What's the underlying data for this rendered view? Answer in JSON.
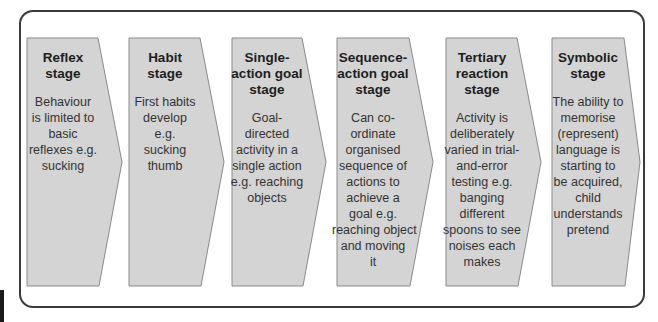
{
  "diagram": {
    "type": "process-chevron-flow",
    "colors": {
      "frame_border": "#3a3a3a",
      "shape_fill": "#d4d4d4",
      "shape_border": "#8a8a8a",
      "text": "#2b2b2b"
    },
    "stages": [
      {
        "title": "Reflex stage",
        "title_lines": [
          "Reflex",
          "stage"
        ],
        "description": "Behaviour is limited to basic reflexes e.g. sucking",
        "description_lines": [
          "Behaviour",
          "is limited to",
          "basic",
          "reflexes e.g.",
          "sucking"
        ]
      },
      {
        "title": "Habit stage",
        "title_lines": [
          "Habit",
          "stage"
        ],
        "description": "First habits develop e.g. sucking thumb",
        "description_lines": [
          "First habits",
          "develop",
          "e.g.",
          "sucking",
          "thumb"
        ]
      },
      {
        "title": "Single-action goal stage",
        "title_lines": [
          "Single-",
          "action goal",
          "stage"
        ],
        "description": "Goal-directed activity in a single action e.g. reaching objects",
        "description_lines": [
          "Goal-directed",
          "activity in a",
          "single action",
          "e.g. reaching",
          "objects"
        ]
      },
      {
        "title": "Sequence-action goal stage",
        "title_lines": [
          "Sequence-",
          "action goal",
          "stage"
        ],
        "description": "Can co-ordinate organised sequence of actions to achieve a goal e.g. reaching object and moving it",
        "description_lines": [
          "Can co-",
          "ordinate",
          "organised",
          "sequence of",
          "actions to",
          "achieve a",
          "goal e.g.",
          "reaching object",
          "and moving it"
        ]
      },
      {
        "title": "Tertiary reaction stage",
        "title_lines": [
          "Tertiary",
          "reaction",
          "stage"
        ],
        "description": "Activity is deliberately varied in trial-and-error testing e.g. banging different spoons to see noises each makes",
        "description_lines": [
          "Activity is",
          "deliberately",
          "varied in trial-",
          "and-error",
          "testing e.g.",
          "banging",
          "different",
          "spoons to see",
          "noises each",
          "makes"
        ]
      },
      {
        "title": "Symbolic stage",
        "title_lines": [
          "Symbolic",
          "stage"
        ],
        "description": "The ability to memorise (represent) language is starting to be acquired, child understands pretend",
        "description_lines": [
          "The ability to",
          "memorise",
          "(represent)",
          "language is",
          "starting to",
          "be acquired,",
          "child",
          "understands",
          "pretend"
        ]
      }
    ]
  }
}
